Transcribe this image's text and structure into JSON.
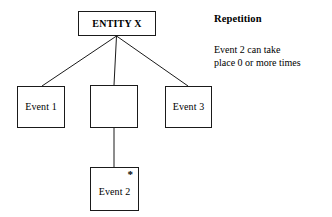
{
  "diagram": {
    "type": "entity-event-decomposition",
    "notation_symbol": "*",
    "nodes": [
      {
        "id": "entity",
        "label": "ENTITY X",
        "bold": true
      },
      {
        "id": "event1",
        "label": "Event 1",
        "bold": false
      },
      {
        "id": "group",
        "label": "",
        "bold": false
      },
      {
        "id": "event3",
        "label": "Event 3",
        "bold": false
      },
      {
        "id": "event2",
        "label": "Event 2",
        "bold": false,
        "marker": "*"
      }
    ],
    "connectors": [
      {
        "from": "entity",
        "to": "event1"
      },
      {
        "from": "entity",
        "to": "group"
      },
      {
        "from": "entity",
        "to": "event3"
      },
      {
        "from": "group",
        "to": "event2"
      }
    ]
  },
  "annotation": {
    "title": "Repetition",
    "lines": [
      "Event 2 can take",
      "place 0 or more times"
    ]
  },
  "colors": {
    "stroke": "#1a1a1a",
    "text": "#000000",
    "background": "#ffffff"
  }
}
